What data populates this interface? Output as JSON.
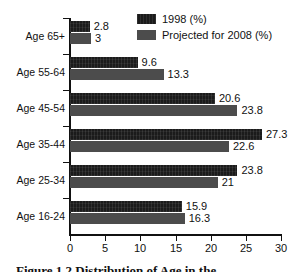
{
  "chart_data": {
    "type": "bar",
    "orientation": "horizontal",
    "title": "",
    "xlabel": "",
    "ylabel": "",
    "xlim": [
      0,
      30
    ],
    "xticks": [
      0,
      5,
      10,
      15,
      20,
      25,
      30
    ],
    "grid": false,
    "legend_position": "top-right",
    "categories": [
      "Age 65+",
      "Age 55-64",
      "Age 45-54",
      "Age 35-44",
      "Age 25-34",
      "Age 16-24"
    ],
    "series": [
      {
        "name": "1998 (%)",
        "color": "#1b1b1b",
        "values": [
          2.8,
          9.6,
          20.6,
          27.3,
          23.8,
          15.9
        ],
        "labels": [
          "2.8",
          "9.6",
          "20.6",
          "27.3",
          "23.8",
          "15.9"
        ]
      },
      {
        "name": "Projected for 2008 (%)",
        "color": "#4c4c4c",
        "values": [
          3,
          13.3,
          23.8,
          22.6,
          21,
          16.3
        ],
        "labels": [
          "3",
          "13.3",
          "23.8",
          "22.6",
          "21",
          "16.3"
        ]
      }
    ]
  },
  "legend": {
    "items": [
      {
        "label": "1998 (%)",
        "swatch": "legend-swatch-dark"
      },
      {
        "label": "Projected for 2008 (%)",
        "swatch": "legend-swatch-gray"
      }
    ]
  },
  "axis": {
    "x_tick_labels": [
      "0",
      "5",
      "10",
      "15",
      "20",
      "25",
      "30"
    ]
  },
  "caption": {
    "text": "Figure 1.2   Distribution of Age in the"
  }
}
